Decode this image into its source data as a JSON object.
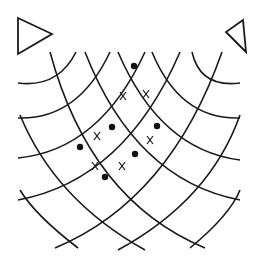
{
  "diagram": {
    "title": "",
    "type": "two-source wave interference",
    "colors": {
      "stroke": "#1a1a1a",
      "background": "#ffffff"
    },
    "sources": [
      {
        "name": "left-source",
        "shape": "triangle",
        "points": "18,18 52,34 18,54"
      },
      {
        "name": "right-source",
        "shape": "triangle",
        "points": "243,20 226,32 246,52"
      }
    ],
    "left_wavefronts": [
      {
        "d": "M18,83 Q58,88 76,52"
      },
      {
        "d": "M18,118 Q78,120 110,52"
      },
      {
        "d": "M18,158 Q100,150 145,52"
      },
      {
        "d": "M18,200 Q125,180 180,52"
      },
      {
        "d": "M55,248 Q170,200 222,52"
      },
      {
        "d": "M118,250 Q210,200 240,115"
      },
      {
        "d": "M190,248 Q230,215 240,190"
      }
    ],
    "right_wavefronts": [
      {
        "d": "M240,83 Q200,88 192,52"
      },
      {
        "d": "M240,118 Q180,120 152,52"
      },
      {
        "d": "M240,160 Q160,150 118,52"
      },
      {
        "d": "M240,200 Q135,180 85,52"
      },
      {
        "d": "M205,248 Q90,200 50,52"
      },
      {
        "d": "M145,250 Q55,200 20,115"
      },
      {
        "d": "M78,248 Q35,215 20,190"
      }
    ],
    "nodes": [
      {
        "x": 134,
        "y": 66
      },
      {
        "x": 112,
        "y": 127
      },
      {
        "x": 157,
        "y": 126
      },
      {
        "x": 80,
        "y": 147
      },
      {
        "x": 135,
        "y": 154
      },
      {
        "x": 105,
        "y": 177
      }
    ],
    "cross_marks": [
      {
        "x": 123,
        "y": 96
      },
      {
        "x": 146,
        "y": 94
      },
      {
        "x": 97,
        "y": 136
      },
      {
        "x": 150,
        "y": 140
      },
      {
        "x": 95,
        "y": 166
      },
      {
        "x": 122,
        "y": 166
      }
    ]
  }
}
